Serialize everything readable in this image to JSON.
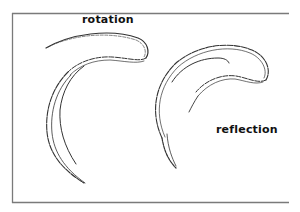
{
  "figure": {
    "labels": {
      "rotation": "rotation",
      "reflection": "reflection"
    },
    "colors": {
      "frame": "#7a7a7a",
      "stroke": "#333333",
      "background": "#ffffff"
    },
    "shapes": [
      {
        "name": "rotation-shape",
        "description": "hook-shaped curve, rotated"
      },
      {
        "name": "reflection-shape",
        "description": "hook-shaped curve, mirrored"
      }
    ]
  }
}
